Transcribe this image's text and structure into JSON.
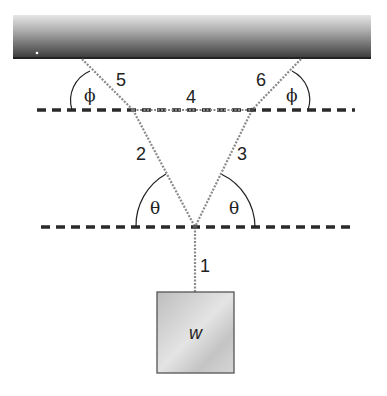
{
  "diagram": {
    "type": "static-equilibrium-rope-system",
    "ceiling": {
      "label": ""
    },
    "ropes": [
      {
        "id": "1",
        "label": "1"
      },
      {
        "id": "2",
        "label": "2"
      },
      {
        "id": "3",
        "label": "3"
      },
      {
        "id": "4",
        "label": "4"
      },
      {
        "id": "5",
        "label": "5"
      },
      {
        "id": "6",
        "label": "6"
      }
    ],
    "angles": {
      "phi_left": "ϕ",
      "phi_right": "ϕ",
      "theta_left": "θ",
      "theta_right": "θ"
    },
    "weight": {
      "label": "w"
    },
    "colors": {
      "ceiling_dark": "#3a3a3a",
      "ceiling_light": "#d8d8d8",
      "rope": "#8a8a8a",
      "dashed_line": "#2a2a2a",
      "box_fill": "#c8c8c8",
      "box_border": "#555555"
    }
  }
}
